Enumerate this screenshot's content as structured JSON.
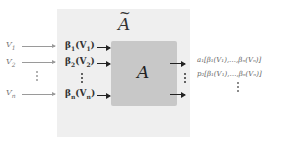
{
  "diagram": {
    "outer_title": "A",
    "outer_title_tilde": "~",
    "inner_label": "A",
    "inputs": [
      {
        "label": "V",
        "sub": "1"
      },
      {
        "label": "V",
        "sub": "2"
      },
      {
        "label": "V",
        "sub": "n"
      }
    ],
    "betas": [
      {
        "label": "β",
        "sub": "1",
        "arg": "(V",
        "argsub": "1",
        "close": ")"
      },
      {
        "label": "β",
        "sub": "2",
        "arg": "(V",
        "argsub": "2",
        "close": ")"
      },
      {
        "label": "β",
        "sub": "n",
        "arg": "(V",
        "argsub": "n",
        "close": ")"
      }
    ],
    "outputs": [
      "a₁[β₁(V₁),…,βₙ(Vₙ)]",
      "p₂[β₁(V₁),…,βₙ(Vₙ)]"
    ],
    "colors": {
      "panel": "#efefef",
      "box": "#c8c8c8",
      "arrow": "#222222",
      "input_arrow": "#9a9a9a"
    }
  }
}
